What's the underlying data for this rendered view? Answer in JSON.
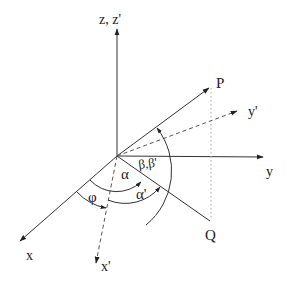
{
  "diagram": {
    "type": "coordinate-rotation",
    "labels": {
      "z_axis": "z, z'",
      "y_axis": "y",
      "y_prime_axis": "y'",
      "x_axis": "x",
      "x_prime_axis": "x'",
      "point_p": "P",
      "point_q": "Q",
      "angle_alpha": "α",
      "angle_alpha_prime": "α'",
      "angle_beta": "β,β'",
      "angle_phi": "φ"
    },
    "colors": {
      "line": "#333333",
      "dashed": "#555555",
      "dotted": "#999999",
      "background": "#ffffff"
    }
  }
}
